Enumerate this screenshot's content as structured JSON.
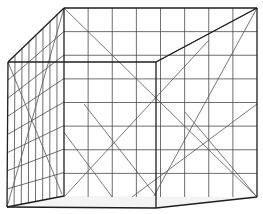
{
  "diagram": {
    "title": "",
    "colors": {
      "background": "#ffffff",
      "grid": "#4a4a4a",
      "edge": "#1e1e1e",
      "floor": "#f4f4f4"
    },
    "back_wall": {
      "x0": 64,
      "y0": 8,
      "x1": 257,
      "y1": 197,
      "columns": 8,
      "rows": 8
    },
    "vertices": {
      "back_top_left": [
        64,
        8
      ],
      "back_top_right": [
        257,
        8
      ],
      "back_bottom_left": [
        64,
        196
      ],
      "back_bottom_right": [
        257,
        197
      ],
      "front_top_left": [
        8,
        62
      ],
      "front_bottom_left": [
        7,
        207
      ],
      "front_top_mid": [
        156,
        62
      ],
      "front_bottom_mid": [
        156,
        208
      ]
    }
  }
}
